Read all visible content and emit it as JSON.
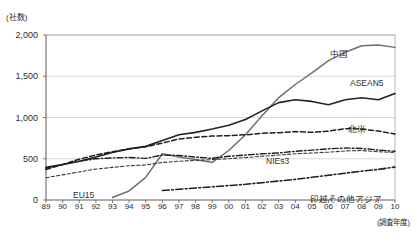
{
  "chart_data": {
    "type": "line",
    "title": "",
    "ylabel": "(社数)",
    "xlabel": "(調査年度)",
    "ylim": [
      0,
      2000
    ],
    "yticks": [
      0,
      500,
      1000,
      1500,
      2000
    ],
    "ytick_labels": [
      "0",
      "500",
      "1,000",
      "1,500",
      "2,000"
    ],
    "grid": true,
    "legend": "inline-annotations",
    "categories": [
      "89",
      "90",
      "91",
      "92",
      "93",
      "94",
      "95",
      "96",
      "97",
      "98",
      "99",
      "00",
      "01",
      "02",
      "03",
      "04",
      "05",
      "06",
      "07",
      "08",
      "09",
      "10"
    ],
    "series": [
      {
        "name": "中国",
        "style": "solid-gray",
        "color": "#6f6f6f",
        "label_x": 330,
        "label_y": 47,
        "values": [
          null,
          null,
          null,
          null,
          30,
          110,
          275,
          560,
          520,
          490,
          455,
          600,
          790,
          1020,
          1240,
          1400,
          1540,
          1690,
          1790,
          1870,
          1880,
          1850
        ]
      },
      {
        "name": "ASEAN5",
        "style": "solid-black",
        "color": "#222222",
        "label_x": 350,
        "label_y": 78,
        "values": [
          395,
          430,
          470,
          520,
          575,
          620,
          650,
          720,
          790,
          820,
          860,
          905,
          975,
          1080,
          1180,
          1215,
          1195,
          1155,
          1215,
          1240,
          1215,
          1290
        ]
      },
      {
        "name": "北米",
        "style": "dashed",
        "color": "#1f1f1f",
        "label_x": 348,
        "label_y": 122,
        "values": [
          370,
          430,
          495,
          545,
          585,
          620,
          645,
          690,
          740,
          760,
          775,
          780,
          790,
          810,
          815,
          830,
          820,
          835,
          865,
          860,
          835,
          800
        ]
      },
      {
        "name": "NIEs3",
        "style": "dashdot",
        "color": "#1f1f1f",
        "label_x": 266,
        "label_y": 156,
        "values": [
          385,
          430,
          470,
          500,
          510,
          515,
          505,
          545,
          540,
          520,
          505,
          530,
          545,
          560,
          570,
          590,
          605,
          620,
          630,
          625,
          605,
          590
        ]
      },
      {
        "name": "EU15",
        "style": "dashed-fine",
        "color": "#3a3a3a",
        "label_x": 73,
        "label_y": 190,
        "values": [
          270,
          305,
          340,
          375,
          395,
          415,
          425,
          455,
          470,
          480,
          490,
          500,
          515,
          530,
          545,
          560,
          570,
          580,
          595,
          600,
          585,
          575
        ]
      },
      {
        "name": "印越その他アジア",
        "style": "dashdot-bold",
        "color": "#1f1f1f",
        "label_x": 310,
        "label_y": 192,
        "values": [
          null,
          null,
          null,
          null,
          null,
          null,
          null,
          115,
          130,
          145,
          160,
          175,
          190,
          210,
          230,
          250,
          275,
          300,
          325,
          350,
          370,
          400
        ]
      }
    ]
  }
}
